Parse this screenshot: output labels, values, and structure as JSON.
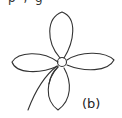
{
  "figure": {
    "panel_label": "(b)",
    "top_text_fragment": "p , g",
    "stroke_color": "#333333",
    "background": "#ffffff"
  }
}
